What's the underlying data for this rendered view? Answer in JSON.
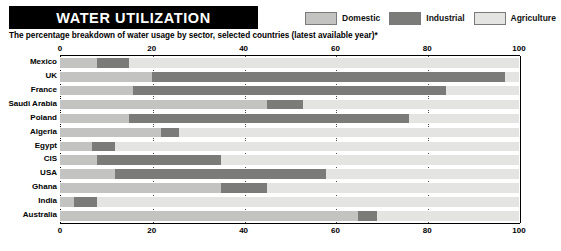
{
  "header": {
    "title": "WATER UTILIZATION",
    "subtitle": "The percentage breakdown of water usage by sector, selected countries (latest available year)*"
  },
  "legend": {
    "items": [
      {
        "label": "Domestic",
        "color": "#c3c3c1"
      },
      {
        "label": "Industrial",
        "color": "#7b7b79"
      },
      {
        "label": "Agriculture",
        "color": "#e4e4e2"
      }
    ]
  },
  "axis": {
    "ticks": [
      "0",
      "20",
      "40",
      "60",
      "80",
      "100"
    ],
    "tick_values": [
      0,
      20,
      40,
      60,
      80,
      100
    ],
    "min": 0,
    "max": 100
  },
  "colors": {
    "domestic": "#c3c3c1",
    "industrial": "#7b7b79",
    "agriculture": "#e4e4e2",
    "title_bar_bg": "#000000",
    "title_bar_text": "#ffffff",
    "axis": "#000000",
    "gridline": "#4a4a4a"
  },
  "chart_data": {
    "type": "bar",
    "orientation": "horizontal",
    "stacked": true,
    "stacked_normalized": true,
    "title": "WATER UTILIZATION",
    "subtitle": "The percentage breakdown of water usage by sector, selected countries (latest available year)*",
    "xlabel": "",
    "ylabel": "",
    "xlim": [
      0,
      100
    ],
    "xticks": [
      0,
      20,
      40,
      60,
      80,
      100
    ],
    "grid": true,
    "grid_axis": "x",
    "legend_position": "top-right",
    "categories": [
      "Mexico",
      "UK",
      "France",
      "Saudi Arabia",
      "Poland",
      "Algeria",
      "Egypt",
      "CIS",
      "USA",
      "Ghana",
      "India",
      "Australia"
    ],
    "series": [
      {
        "name": "Domestic",
        "color": "#c3c3c1",
        "values": [
          8,
          20,
          16,
          45,
          15,
          22,
          7,
          8,
          12,
          35,
          3,
          65
        ]
      },
      {
        "name": "Industrial",
        "color": "#7b7b79",
        "values": [
          7,
          77,
          68,
          8,
          61,
          4,
          5,
          27,
          46,
          10,
          5,
          4
        ]
      },
      {
        "name": "Agriculture",
        "color": "#e4e4e2",
        "values": [
          85,
          3,
          16,
          47,
          24,
          74,
          88,
          65,
          42,
          55,
          92,
          31
        ]
      }
    ],
    "rows": [
      {
        "country": "Mexico",
        "domestic": 8,
        "industrial": 7,
        "agriculture": 85
      },
      {
        "country": "UK",
        "domestic": 20,
        "industrial": 77,
        "agriculture": 3
      },
      {
        "country": "France",
        "domestic": 16,
        "industrial": 68,
        "agriculture": 16
      },
      {
        "country": "Saudi Arabia",
        "domestic": 45,
        "industrial": 8,
        "agriculture": 47
      },
      {
        "country": "Poland",
        "domestic": 15,
        "industrial": 61,
        "agriculture": 24
      },
      {
        "country": "Algeria",
        "domestic": 22,
        "industrial": 4,
        "agriculture": 74
      },
      {
        "country": "Egypt",
        "domestic": 7,
        "industrial": 5,
        "agriculture": 88
      },
      {
        "country": "CIS",
        "domestic": 8,
        "industrial": 27,
        "agriculture": 65
      },
      {
        "country": "USA",
        "domestic": 12,
        "industrial": 46,
        "agriculture": 42
      },
      {
        "country": "Ghana",
        "domestic": 35,
        "industrial": 10,
        "agriculture": 55
      },
      {
        "country": "India",
        "domestic": 3,
        "industrial": 5,
        "agriculture": 92
      },
      {
        "country": "Australia",
        "domestic": 65,
        "industrial": 4,
        "agriculture": 31
      }
    ]
  }
}
